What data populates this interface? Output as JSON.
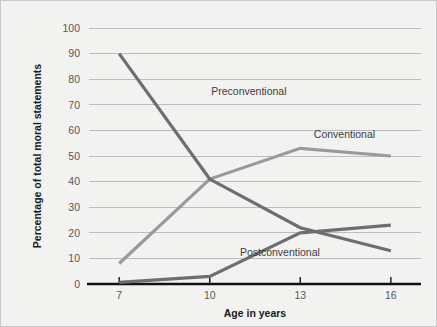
{
  "figure": {
    "background_color": "#f2f2f1",
    "border_color": "#c8c8c8"
  },
  "chart_data": {
    "type": "line",
    "title": "",
    "xlabel": "Age in years",
    "ylabel": "Percentage of total moral statements",
    "x": [
      7,
      10,
      13,
      16
    ],
    "xlim": [
      6,
      17
    ],
    "ylim": [
      0,
      100
    ],
    "xticks": [
      7,
      10,
      13,
      16
    ],
    "xtick_labels": [
      "7",
      "10",
      "13",
      "16"
    ],
    "yticks": [
      0,
      10,
      20,
      30,
      40,
      50,
      60,
      70,
      80,
      90,
      100
    ],
    "ytick_labels": [
      "0",
      "10",
      "20",
      "30",
      "40",
      "50",
      "60",
      "70",
      "80",
      "90",
      "100"
    ],
    "grid": "horizontal",
    "grid_color": "#bdbdbd",
    "legend": "inline-labels",
    "series": [
      {
        "name": "Preconventional",
        "values": [
          90,
          41,
          22,
          13
        ],
        "color": "#6e6e70",
        "line_width": 3.2,
        "label_x": 10.05,
        "label_y": 74
      },
      {
        "name": "Conventional",
        "values": [
          8,
          41,
          53,
          50
        ],
        "color": "#9a9a9c",
        "line_width": 3.2,
        "label_x": 13.45,
        "label_y": 57
      },
      {
        "name": "Postconventional",
        "values": [
          0.6,
          3,
          20,
          23
        ],
        "color": "#6e6e70",
        "line_width": 3.2,
        "label_x": 11.0,
        "label_y": 11
      }
    ]
  }
}
